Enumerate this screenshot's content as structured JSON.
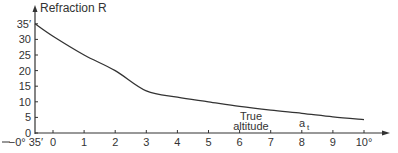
{
  "chart_data": {
    "type": "line",
    "title": "",
    "ylabel": "Refraction R",
    "xlabel": "True altitude",
    "x_symbol": "a_t",
    "x_unit": "°",
    "y_unit": "′",
    "x_origin_label": "−0° 35′",
    "xticks": [
      0,
      1,
      2,
      3,
      4,
      5,
      6,
      7,
      8,
      9,
      10
    ],
    "xtick_labels": [
      "0",
      "1",
      "2",
      "3",
      "4",
      "5",
      "6",
      "7",
      "8",
      "9",
      "10°"
    ],
    "yticks": [
      0,
      5,
      10,
      15,
      20,
      25,
      30,
      35
    ],
    "ytick_labels": [
      "0",
      "5",
      "10",
      "15",
      "20",
      "25",
      "30",
      "35′"
    ],
    "xlim": [
      -0.583,
      10.5
    ],
    "ylim": [
      0,
      37
    ],
    "grid": false,
    "series": [
      {
        "name": "Refraction R",
        "x": [
          -0.583,
          0,
          1,
          2,
          3,
          4,
          5,
          6,
          7,
          8,
          9,
          10
        ],
        "y": [
          35,
          31,
          25,
          20,
          13.5,
          11.5,
          10,
          8.5,
          7.3,
          6.3,
          5.2,
          4.3
        ]
      }
    ],
    "color": "#333333"
  }
}
